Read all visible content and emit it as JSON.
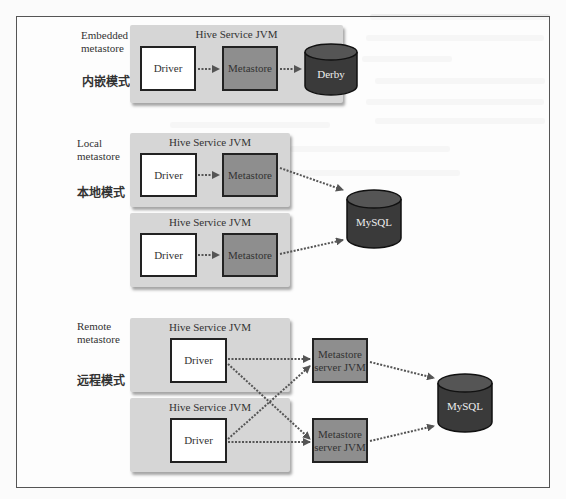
{
  "diagram": {
    "colors": {
      "frame": "#555555",
      "jvm_container": "#d6d6d6",
      "driver_box": "#ffffff",
      "metastore_box": "#8e8e8e",
      "database": "#3a3a3a",
      "arrow": "#555555"
    },
    "sections": [
      {
        "id": "embedded",
        "label_en": "Embedded\nmetastore",
        "label_zh": "内嵌模式",
        "jvms": [
          {
            "title": "Hive Service JVM",
            "driver": "Driver",
            "metastore": "Metastore",
            "database": "Derby"
          }
        ]
      },
      {
        "id": "local",
        "label_en": "Local\nmetastore",
        "label_zh": "本地模式",
        "jvms": [
          {
            "title": "Hive Service JVM",
            "driver": "Driver",
            "metastore": "Metastore"
          },
          {
            "title": "Hive Service JVM",
            "driver": "Driver",
            "metastore": "Metastore"
          }
        ],
        "database": "MySQL"
      },
      {
        "id": "remote",
        "label_en": "Remote\nmetastore",
        "label_zh": "远程模式",
        "jvms": [
          {
            "title": "Hive Service JVM",
            "driver": "Driver"
          },
          {
            "title": "Hive Service JVM",
            "driver": "Driver"
          }
        ],
        "metastore_servers": [
          "Metastore\nserver JVM",
          "Metastore\nserver JVM"
        ],
        "database": "MySQL"
      }
    ],
    "edges": [
      {
        "from": "Driver (embedded)",
        "to": "Metastore (embedded)"
      },
      {
        "from": "Metastore (embedded)",
        "to": "Derby"
      },
      {
        "from": "Driver (local 1)",
        "to": "Metastore (local 1)"
      },
      {
        "from": "Driver (local 2)",
        "to": "Metastore (local 2)"
      },
      {
        "from": "Metastore (local 1)",
        "to": "MySQL (local)"
      },
      {
        "from": "Metastore (local 2)",
        "to": "MySQL (local)"
      },
      {
        "from": "Driver (remote 1)",
        "to": "Metastore server JVM 1"
      },
      {
        "from": "Driver (remote 1)",
        "to": "Metastore server JVM 2"
      },
      {
        "from": "Driver (remote 2)",
        "to": "Metastore server JVM 1"
      },
      {
        "from": "Driver (remote 2)",
        "to": "Metastore server JVM 2"
      },
      {
        "from": "Metastore server JVM 1",
        "to": "MySQL (remote)"
      },
      {
        "from": "Metastore server JVM 2",
        "to": "MySQL (remote)"
      }
    ]
  }
}
